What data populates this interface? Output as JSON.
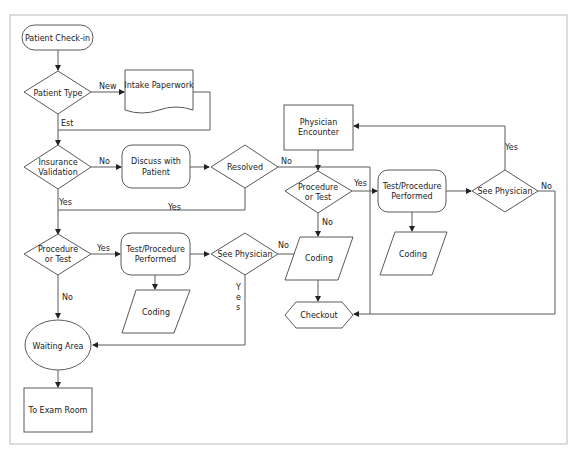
{
  "diagram": {
    "type": "flowchart",
    "nodes": {
      "checkin": {
        "label": "Patient Check-in",
        "shape": "terminator"
      },
      "patient_type": {
        "label": "Patient Type",
        "shape": "decision"
      },
      "intake": {
        "label": "Intake Paperwork",
        "shape": "document"
      },
      "insurance_l1": {
        "label": "Insurance",
        "shape": "decision"
      },
      "insurance_l2": {
        "label": "Validation"
      },
      "discuss_l1": {
        "label": "Discuss with",
        "shape": "rounded-process"
      },
      "discuss_l2": {
        "label": "Patient"
      },
      "resolved": {
        "label": "Resolved",
        "shape": "decision"
      },
      "proc1_l1": {
        "label": "Procedure",
        "shape": "decision"
      },
      "proc1_l2": {
        "label": "or Test"
      },
      "test1_l1": {
        "label": "Test/Procedure",
        "shape": "rounded-process"
      },
      "test1_l2": {
        "label": "Performed"
      },
      "seephys1": {
        "label": "See Physician",
        "shape": "decision"
      },
      "coding1": {
        "label": "Coding",
        "shape": "data"
      },
      "waiting": {
        "label": "Waiting Area",
        "shape": "ellipse"
      },
      "exam": {
        "label": "To Exam Room",
        "shape": "process"
      },
      "physenc_l1": {
        "label": "Physician",
        "shape": "process"
      },
      "physenc_l2": {
        "label": "Encounter"
      },
      "proc2_l1": {
        "label": "Procedure",
        "shape": "decision"
      },
      "proc2_l2": {
        "label": "or Test"
      },
      "coding2": {
        "label": "Coding",
        "shape": "data"
      },
      "checkout": {
        "label": "Checkout",
        "shape": "preparation"
      },
      "test2_l1": {
        "label": "Test/Procedure",
        "shape": "rounded-process"
      },
      "test2_l2": {
        "label": "Performed"
      },
      "seephys2": {
        "label": "See Physician",
        "shape": "decision"
      },
      "coding3": {
        "label": "Coding",
        "shape": "data"
      }
    },
    "edges": {
      "pt_new": "New",
      "pt_est": "Est",
      "ins_no": "No",
      "ins_yes": "Yes",
      "res_yes": "Yes",
      "res_no": "No",
      "proc1_yes": "Yes",
      "proc1_no": "No",
      "sp1_no": "No",
      "sp1_yes_y": "Y",
      "sp1_yes_e": "e",
      "sp1_yes_s": "s",
      "proc2_yes": "Yes",
      "proc2_no": "No",
      "sp2_yes": "Yes",
      "sp2_no": "No"
    }
  }
}
